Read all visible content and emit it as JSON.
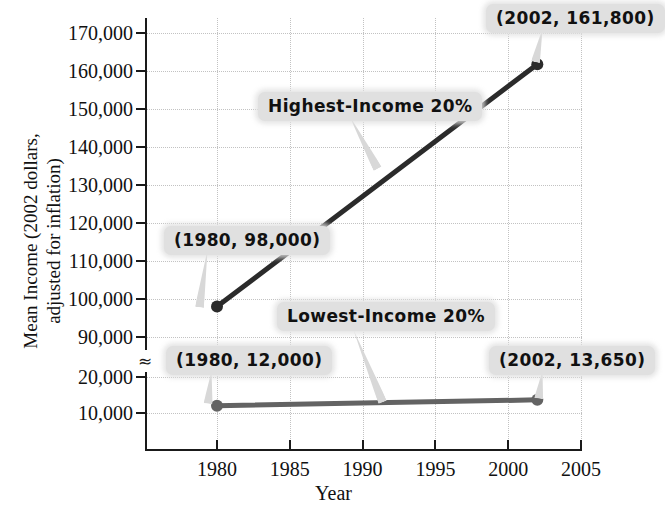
{
  "chart_data": {
    "type": "line",
    "title": "",
    "xlabel": "Year",
    "ylabel": "Mean Income (2002 dollars,\nadjusted for inflation)",
    "grid": true,
    "legend_position": "inline-annotations",
    "xlim": [
      1976,
      2005
    ],
    "ylim": [
      0,
      170000
    ],
    "y_axis_break": {
      "present": true,
      "between": [
        20000,
        90000
      ],
      "symbol": "≈"
    },
    "x_ticks": [
      "1980",
      "1985",
      "1990",
      "1995",
      "2000",
      "2005"
    ],
    "x_tick_values": [
      1980,
      1985,
      1990,
      1995,
      2000,
      2005
    ],
    "y_ticks": [
      "170,000",
      "160,000",
      "150,000",
      "140,000",
      "130,000",
      "120,000",
      "110,000",
      "100,000",
      "90,000",
      "20,000",
      "10,000"
    ],
    "y_tick_values": [
      170000,
      160000,
      150000,
      140000,
      130000,
      120000,
      110000,
      100000,
      90000,
      20000,
      10000
    ],
    "series": [
      {
        "name": "Highest-Income 20%",
        "color": "#2b2b2b",
        "x": [
          1980,
          2002
        ],
        "values": [
          98000,
          161800
        ],
        "point_labels": [
          "(1980, 98,000)",
          "(2002, 161,800)"
        ]
      },
      {
        "name": "Lowest-Income 20%",
        "color": "#636363",
        "x": [
          1980,
          2002
        ],
        "values": [
          12000,
          13650
        ],
        "point_labels": [
          "(1980, 12,000)",
          "(2002, 13,650)"
        ]
      }
    ],
    "annotations": [
      {
        "id": "highest-series-label",
        "text": "Highest-Income 20%"
      },
      {
        "id": "lowest-series-label",
        "text": "Lowest-Income 20%"
      },
      {
        "id": "point-1980-98000",
        "text": "(1980, 98,000)"
      },
      {
        "id": "point-2002-161800",
        "text": "(2002, 161,800)"
      },
      {
        "id": "point-1980-12000",
        "text": "(1980, 12,000)"
      },
      {
        "id": "point-2002-13650",
        "text": "(2002, 13,650)"
      }
    ]
  },
  "axes": {
    "y_title": "Mean Income (2002 dollars,\nadjusted for inflation)",
    "x_title": "Year"
  },
  "colors": {
    "high_series": "#2b2b2b",
    "low_series": "#636363",
    "callout_bg": "#e0e0e0",
    "axis": "#1a1a1a",
    "grid": "#c2c2c2"
  }
}
